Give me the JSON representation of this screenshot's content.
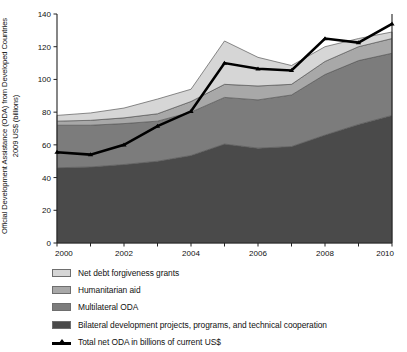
{
  "chart_data": {
    "type": "area",
    "title": "",
    "subtitle": "",
    "xlabel": "",
    "ylabel": "Official Development Assistance (ODA) from Developed Countries 2009 US$ (billions)",
    "ylabel_line1": "Official Development Assistance (ODA) from Developed Countries",
    "ylabel_line2": "2009 US$ (billions)",
    "stacked": true,
    "grid": false,
    "legend_position": "below",
    "x": [
      2000,
      2001,
      2002,
      2003,
      2004,
      2005,
      2006,
      2007,
      2008,
      2009,
      2010
    ],
    "xlim": [
      2000,
      2010
    ],
    "ylim": [
      0,
      140
    ],
    "yticks": [
      0,
      20,
      40,
      60,
      80,
      100,
      120,
      140
    ],
    "ytick_labels": [
      "0",
      "20",
      "40",
      "60",
      "80",
      "100",
      "120",
      "140"
    ],
    "xticks": [
      2000,
      2001,
      2002,
      2003,
      2004,
      2005,
      2006,
      2007,
      2008,
      2009,
      2010
    ],
    "xtick_labels": [
      "2000",
      "",
      "2002",
      "",
      "2004",
      "",
      "2006",
      "",
      "2008",
      "",
      "2010"
    ],
    "xtick_labels_shown": [
      "2000",
      "2002",
      "2004",
      "2006",
      "2008",
      "2010"
    ],
    "series": [
      {
        "name": "Bilateral development projects, programs, and technical cooperation",
        "color": "#4a4a4a",
        "values": [
          46,
          46.5,
          48,
          50,
          53.5,
          60.5,
          58,
          59,
          66,
          72.5,
          78
        ]
      },
      {
        "name": "Multilateral ODA",
        "color": "#7c7c7c",
        "values": [
          26,
          25.5,
          25,
          24.5,
          26.5,
          28.5,
          29.5,
          31.5,
          37,
          39,
          38
        ]
      },
      {
        "name": "Humanitarian aid",
        "color": "#a8a8a8",
        "values": [
          2.5,
          3,
          3.5,
          4.5,
          6.5,
          8,
          8.5,
          6.5,
          8,
          8.5,
          9
        ]
      },
      {
        "name": "Net debt forgiveness grants",
        "color": "#d6d6d6",
        "values": [
          3.5,
          4.5,
          6,
          9,
          7.5,
          26.5,
          17.5,
          11.5,
          9,
          5,
          4
        ]
      }
    ],
    "cumulative_tops": {
      "bilateral": [
        46,
        46.5,
        48,
        50,
        53.5,
        60.5,
        58,
        59,
        66,
        72.5,
        78
      ],
      "multilateral": [
        72,
        72,
        73,
        74.5,
        80,
        89,
        87.5,
        90.5,
        103,
        111.5,
        116
      ],
      "humanitarian": [
        74.5,
        75,
        76.5,
        79,
        86.5,
        97,
        96,
        97,
        111,
        120,
        125
      ],
      "net_debt": [
        78,
        79.5,
        82.5,
        88,
        94,
        123.5,
        113.5,
        108.5,
        120,
        125,
        129
      ]
    },
    "line_series": {
      "name": "Total net ODA in billions of current US$",
      "color": "#000000",
      "values": [
        55.5,
        54,
        60,
        71.5,
        80.5,
        110,
        106.5,
        105.5,
        125,
        122.5,
        134
      ]
    }
  },
  "legend": {
    "items": [
      {
        "label": "Net debt forgiveness grants",
        "swatch_name": "swatch-net-debt-forgiveness-grants",
        "color": "#d6d6d6",
        "kind": "area"
      },
      {
        "label": "Humanitarian aid",
        "swatch_name": "swatch-humanitarian-aid",
        "color": "#a8a8a8",
        "kind": "area"
      },
      {
        "label": "Multilateral ODA",
        "swatch_name": "swatch-multilateral-oda",
        "color": "#7c7c7c",
        "kind": "area"
      },
      {
        "label": "Bilateral development projects, programs, and technical cooperation",
        "swatch_name": "swatch-bilateral-development",
        "color": "#4a4a4a",
        "kind": "area"
      },
      {
        "label": "Total net ODA in billions of current US$",
        "swatch_name": "swatch-total-net-oda-line",
        "color": "#000000",
        "kind": "line"
      }
    ]
  }
}
